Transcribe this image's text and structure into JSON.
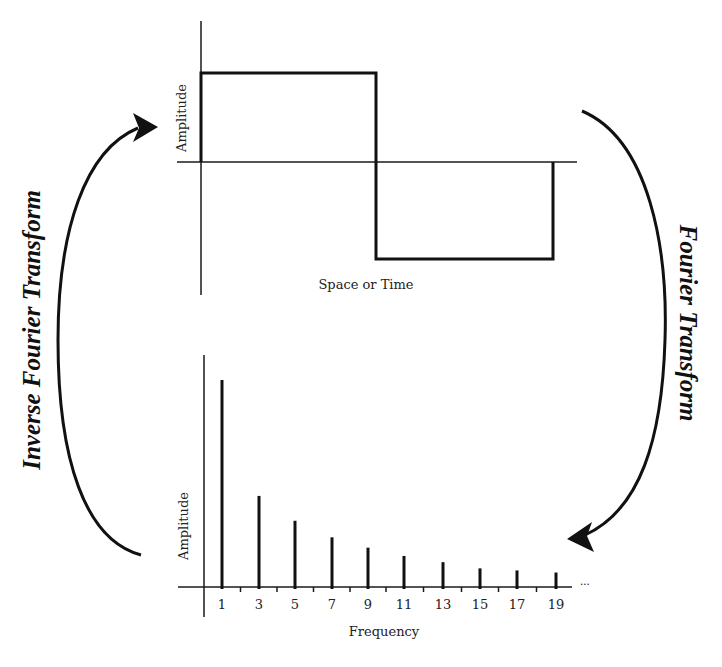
{
  "diagram": {
    "top_plot": {
      "title": "Square wave in space/time domain",
      "y_label": "Amplitude",
      "x_label": "Space or Time",
      "wave": {
        "x_start": 201,
        "x_mid": 376,
        "x_end": 553,
        "y_high": 73,
        "y_zero": 162,
        "y_low": 259
      }
    },
    "bottom_plot": {
      "title": "Frequency spectrum",
      "y_label": "Amplitude",
      "x_label": "Frequency",
      "continuation": "..."
    },
    "arrows": {
      "forward": {
        "label": "Fourier Transform",
        "direction": "top-to-bottom",
        "side": "right"
      },
      "inverse": {
        "label": "Inverse Fourier Transform",
        "direction": "bottom-to-top",
        "side": "left"
      }
    },
    "colors": {
      "ink": "#111111",
      "background": "#ffffff"
    }
  },
  "chart_data": [
    {
      "type": "line",
      "title": "Square wave",
      "xlabel": "Space or Time",
      "ylabel": "Amplitude",
      "x": [
        0,
        0,
        0.5,
        0.5,
        1,
        1
      ],
      "values": [
        0,
        1,
        1,
        -1,
        -1,
        0
      ],
      "grid": false
    },
    {
      "type": "bar",
      "title": "Fourier spectrum of square wave (odd harmonics)",
      "xlabel": "Frequency",
      "ylabel": "Amplitude",
      "categories": [
        "1",
        "3",
        "5",
        "7",
        "9",
        "11",
        "13",
        "15",
        "17",
        "19"
      ],
      "values": [
        1.0,
        0.44,
        0.32,
        0.24,
        0.19,
        0.15,
        0.12,
        0.09,
        0.08,
        0.07
      ],
      "ylim": [
        0,
        1.1
      ],
      "grid": false,
      "annotations": [
        "..."
      ]
    }
  ]
}
